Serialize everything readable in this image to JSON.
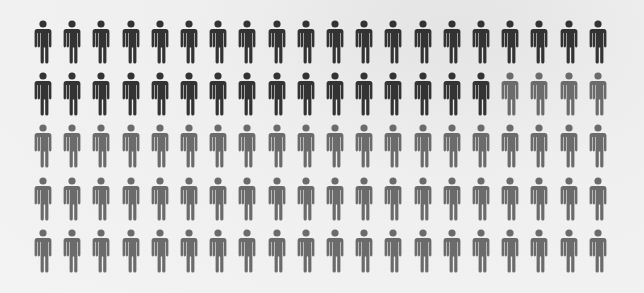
{
  "chart_data": {
    "type": "pictogram",
    "title": "",
    "total_icons": 100,
    "rows": 5,
    "columns": 20,
    "icon": "person-icon",
    "categories": [
      "highlighted",
      "other"
    ],
    "values": [
      36,
      64
    ],
    "series": [
      {
        "name": "highlighted",
        "count": 36,
        "color": "#333333"
      },
      {
        "name": "other",
        "count": 64,
        "color": "#6b6b6b"
      }
    ],
    "row_breakdown": [
      {
        "row": 1,
        "highlighted": 20,
        "other": 0
      },
      {
        "row": 2,
        "highlighted": 16,
        "other": 4
      },
      {
        "row": 3,
        "highlighted": 0,
        "other": 20
      },
      {
        "row": 4,
        "highlighted": 0,
        "other": 20
      },
      {
        "row": 5,
        "highlighted": 0,
        "other": 20
      }
    ],
    "legend": "none",
    "grid": false
  },
  "colors": {
    "highlighted": "#333333",
    "other": "#6b6b6b",
    "background": "#f0f0f0"
  }
}
